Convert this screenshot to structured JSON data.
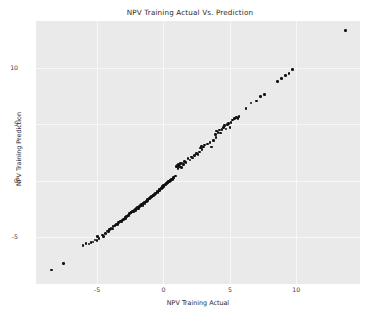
{
  "chart_data": {
    "type": "scatter",
    "title": "NPV Training Actual Vs. Prediction",
    "xlabel": "NPV Training Actual",
    "ylabel": "NPV Training Prediction",
    "xlim": [
      -9.6,
      14.8
    ],
    "ylim": [
      -9.2,
      14.2
    ],
    "xticks": [
      -5,
      0,
      5,
      10
    ],
    "yticks": [
      -5,
      0,
      5,
      10
    ],
    "xtick_labels": [
      "-5",
      "0",
      "5",
      "10"
    ],
    "ytick_labels": [
      "-5",
      "0",
      "5",
      "10"
    ],
    "grid": true,
    "legend": null,
    "panel_background": "#eaeaea",
    "grid_color": "#f7f7f7",
    "marker_color": "#111111",
    "marker_size": 2.6,
    "series": [
      {
        "name": "training points",
        "points": [
          [
            -8.45,
            -7.95
          ],
          [
            -7.55,
            -7.35
          ],
          [
            -6.05,
            -5.75
          ],
          [
            -5.85,
            -5.6
          ],
          [
            -5.6,
            -5.65
          ],
          [
            -5.45,
            -5.5
          ],
          [
            -5.3,
            -5.45
          ],
          [
            -5.15,
            -5.3
          ],
          [
            -5.0,
            -5.35
          ],
          [
            -4.85,
            -5.15
          ],
          [
            -4.95,
            -4.95
          ],
          [
            -4.6,
            -4.85
          ],
          [
            -4.5,
            -5.0
          ],
          [
            -4.35,
            -4.7
          ],
          [
            -4.25,
            -4.5
          ],
          [
            -4.15,
            -4.55
          ],
          [
            -4.05,
            -4.35
          ],
          [
            -3.95,
            -4.25
          ],
          [
            -3.85,
            -4.3
          ],
          [
            -3.8,
            -4.1
          ],
          [
            -3.7,
            -4.05
          ],
          [
            -3.6,
            -3.95
          ],
          [
            -3.55,
            -3.85
          ],
          [
            -3.45,
            -3.9
          ],
          [
            -3.4,
            -3.75
          ],
          [
            -3.3,
            -3.7
          ],
          [
            -3.25,
            -3.6
          ],
          [
            -3.15,
            -3.65
          ],
          [
            -3.1,
            -3.5
          ],
          [
            -3.0,
            -3.45
          ],
          [
            -2.95,
            -3.4
          ],
          [
            -2.9,
            -3.3
          ],
          [
            -2.85,
            -3.35
          ],
          [
            -2.8,
            -3.2
          ],
          [
            -2.7,
            -3.15
          ],
          [
            -2.65,
            -3.05
          ],
          [
            -2.6,
            -3.1
          ],
          [
            -2.55,
            -2.95
          ],
          [
            -2.5,
            -2.9
          ],
          [
            -2.45,
            -2.85
          ],
          [
            -2.4,
            -2.8
          ],
          [
            -2.35,
            -2.75
          ],
          [
            -2.3,
            -2.7
          ],
          [
            -2.25,
            -2.8
          ],
          [
            -2.2,
            -2.6
          ],
          [
            -2.15,
            -2.55
          ],
          [
            -2.1,
            -2.65
          ],
          [
            -2.05,
            -2.5
          ],
          [
            -2.0,
            -2.45
          ],
          [
            -1.95,
            -2.4
          ],
          [
            -1.9,
            -2.5
          ],
          [
            -1.85,
            -2.35
          ],
          [
            -1.8,
            -2.3
          ],
          [
            -1.75,
            -2.2
          ],
          [
            -1.7,
            -2.25
          ],
          [
            -1.65,
            -2.15
          ],
          [
            -1.6,
            -2.1
          ],
          [
            -1.55,
            -2.2
          ],
          [
            -1.5,
            -2.0
          ],
          [
            -1.45,
            -1.95
          ],
          [
            -1.4,
            -2.05
          ],
          [
            -1.35,
            -1.9
          ],
          [
            -1.3,
            -1.8
          ],
          [
            -1.25,
            -1.85
          ],
          [
            -1.2,
            -1.7
          ],
          [
            -1.15,
            -1.75
          ],
          [
            -1.1,
            -1.6
          ],
          [
            -1.05,
            -1.65
          ],
          [
            -1.0,
            -1.5
          ],
          [
            -0.95,
            -1.55
          ],
          [
            -0.9,
            -1.4
          ],
          [
            -0.85,
            -1.45
          ],
          [
            -0.8,
            -1.3
          ],
          [
            -0.75,
            -1.35
          ],
          [
            -0.7,
            -1.2
          ],
          [
            -0.65,
            -1.25
          ],
          [
            -0.6,
            -1.1
          ],
          [
            -0.55,
            -1.15
          ],
          [
            -0.5,
            -1.0
          ],
          [
            -0.45,
            -0.95
          ],
          [
            -0.4,
            -1.05
          ],
          [
            -0.35,
            -0.85
          ],
          [
            -0.3,
            -0.9
          ],
          [
            -0.28,
            -0.75
          ],
          [
            -0.25,
            -0.8
          ],
          [
            -0.2,
            -0.65
          ],
          [
            -0.15,
            -0.7
          ],
          [
            -0.1,
            -0.55
          ],
          [
            -0.05,
            -0.6
          ],
          [
            0.0,
            -0.45
          ],
          [
            0.05,
            -0.5
          ],
          [
            0.1,
            -0.35
          ],
          [
            0.15,
            -0.4
          ],
          [
            0.2,
            -0.25
          ],
          [
            0.25,
            -0.3
          ],
          [
            0.3,
            -0.15
          ],
          [
            0.35,
            -0.2
          ],
          [
            0.4,
            -0.05
          ],
          [
            0.45,
            -0.1
          ],
          [
            0.5,
            0.05
          ],
          [
            0.55,
            0.0
          ],
          [
            0.6,
            0.15
          ],
          [
            0.7,
            0.1
          ],
          [
            0.75,
            0.3
          ],
          [
            0.8,
            0.25
          ],
          [
            0.9,
            0.4
          ],
          [
            0.95,
            1.3
          ],
          [
            1.0,
            1.2
          ],
          [
            1.05,
            1.35
          ],
          [
            1.1,
            1.1
          ],
          [
            1.15,
            1.45
          ],
          [
            1.2,
            1.25
          ],
          [
            1.3,
            1.5
          ],
          [
            1.35,
            1.15
          ],
          [
            1.4,
            1.55
          ],
          [
            1.5,
            1.45
          ],
          [
            1.6,
            1.7
          ],
          [
            1.7,
            1.6
          ],
          [
            1.85,
            1.95
          ],
          [
            2.0,
            1.85
          ],
          [
            2.1,
            2.1
          ],
          [
            2.2,
            2.0
          ],
          [
            2.35,
            2.25
          ],
          [
            2.5,
            2.4
          ],
          [
            2.6,
            2.3
          ],
          [
            2.7,
            2.55
          ],
          [
            2.8,
            2.9
          ],
          [
            2.85,
            3.05
          ],
          [
            2.9,
            2.75
          ],
          [
            3.0,
            3.0
          ],
          [
            3.1,
            3.15
          ],
          [
            3.3,
            3.25
          ],
          [
            3.5,
            3.4
          ],
          [
            3.6,
            3.0
          ],
          [
            3.75,
            3.55
          ],
          [
            3.9,
            4.1
          ],
          [
            3.95,
            3.85
          ],
          [
            4.0,
            4.4
          ],
          [
            4.1,
            4.3
          ],
          [
            4.2,
            4.5
          ],
          [
            4.3,
            4.25
          ],
          [
            4.4,
            4.55
          ],
          [
            4.5,
            4.75
          ],
          [
            4.6,
            4.9
          ],
          [
            4.7,
            4.6
          ],
          [
            4.8,
            5.0
          ],
          [
            4.9,
            5.1
          ],
          [
            5.0,
            4.7
          ],
          [
            5.1,
            5.15
          ],
          [
            5.2,
            5.4
          ],
          [
            5.35,
            5.5
          ],
          [
            5.5,
            5.6
          ],
          [
            5.6,
            5.55
          ],
          [
            5.7,
            5.7
          ],
          [
            6.2,
            6.4
          ],
          [
            6.6,
            6.9
          ],
          [
            7.0,
            7.1
          ],
          [
            7.3,
            7.5
          ],
          [
            7.6,
            7.65
          ],
          [
            8.6,
            8.8
          ],
          [
            8.9,
            9.1
          ],
          [
            9.2,
            9.35
          ],
          [
            9.45,
            9.55
          ],
          [
            9.7,
            9.9
          ],
          [
            13.7,
            13.35
          ]
        ]
      }
    ]
  }
}
